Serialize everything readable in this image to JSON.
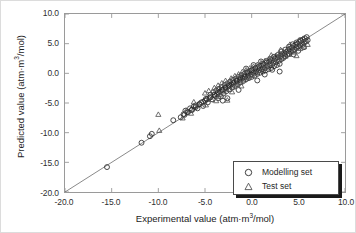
{
  "chart_data": {
    "type": "scatter",
    "title": "",
    "xlabel": "Experimental value (atm·m³/mol)",
    "ylabel": "Predicted value (atm·m³/mol)",
    "xlabel_parts": {
      "pre": "Experimental value (atm·m",
      "sup": "3",
      "post": "/mol)"
    },
    "ylabel_parts": {
      "pre": "Predicted value (atm·m",
      "sup": "3",
      "post": "/mol)"
    },
    "xlim": [
      -20.0,
      10.0
    ],
    "ylim": [
      -20.0,
      10.0
    ],
    "xticks": [
      "-20.0",
      "-15.0",
      "-10.0",
      "-5.0",
      "0.0",
      "5.0",
      "10.0"
    ],
    "yticks": [
      "10.0",
      "5.0",
      "0.0",
      "-5.0",
      "-10.0",
      "-15.0",
      "-20.0"
    ],
    "xtick_values": [
      -20,
      -15,
      -10,
      -5,
      0,
      5,
      10
    ],
    "ytick_values": [
      10,
      5,
      0,
      -5,
      -10,
      -15,
      -20
    ],
    "grid": false,
    "tick_direction": "in",
    "identity_line": {
      "from": [
        -20,
        -20
      ],
      "to": [
        10,
        10
      ],
      "color": "#555555"
    },
    "legend": {
      "position": "bottom-right",
      "entries": [
        {
          "label": "Modelling set",
          "marker": "circle"
        },
        {
          "label": "Test set",
          "marker": "triangle"
        }
      ]
    },
    "series": [
      {
        "name": "Modelling set",
        "marker": "circle",
        "color": "#2a2a2a",
        "points": [
          [
            -15.5,
            -15.8
          ],
          [
            -11.8,
            -11.7
          ],
          [
            -10.9,
            -10.6
          ],
          [
            -10.7,
            -10.2
          ],
          [
            -8.4,
            -7.9
          ],
          [
            -7.6,
            -7.4
          ],
          [
            -7.3,
            -6.9
          ],
          [
            -7.1,
            -6.3
          ],
          [
            -6.9,
            -6.6
          ],
          [
            -6.6,
            -5.9
          ],
          [
            -6.4,
            -6.2
          ],
          [
            -6.2,
            -5.6
          ],
          [
            -6.0,
            -5.4
          ],
          [
            -5.8,
            -5.9
          ],
          [
            -5.6,
            -5.2
          ],
          [
            -5.4,
            -4.9
          ],
          [
            -5.2,
            -5.5
          ],
          [
            -5.0,
            -4.6
          ],
          [
            -4.9,
            -4.3
          ],
          [
            -4.7,
            -4.9
          ],
          [
            -4.5,
            -4.1
          ],
          [
            -4.4,
            -3.6
          ],
          [
            -4.2,
            -4.4
          ],
          [
            -4.1,
            -3.2
          ],
          [
            -3.9,
            -3.8
          ],
          [
            -3.8,
            -2.9
          ],
          [
            -3.7,
            -3.5
          ],
          [
            -3.6,
            -4.2
          ],
          [
            -3.5,
            -2.6
          ],
          [
            -3.4,
            -3.1
          ],
          [
            -3.3,
            -3.9
          ],
          [
            -3.2,
            -2.3
          ],
          [
            -3.1,
            -2.8
          ],
          [
            -3.0,
            -3.4
          ],
          [
            -2.9,
            -2.0
          ],
          [
            -2.8,
            -2.5
          ],
          [
            -2.7,
            -3.0
          ],
          [
            -2.6,
            -1.7
          ],
          [
            -2.5,
            -2.2
          ],
          [
            -2.4,
            -2.7
          ],
          [
            -2.3,
            -1.4
          ],
          [
            -2.2,
            -1.9
          ],
          [
            -2.1,
            -2.4
          ],
          [
            -2.0,
            -1.1
          ],
          [
            -1.9,
            -1.6
          ],
          [
            -1.8,
            -2.1
          ],
          [
            -1.7,
            -0.9
          ],
          [
            -1.6,
            -1.3
          ],
          [
            -1.5,
            -1.8
          ],
          [
            -1.4,
            -0.6
          ],
          [
            -1.3,
            -1.1
          ],
          [
            -1.2,
            -1.5
          ],
          [
            -1.1,
            -0.3
          ],
          [
            -1.0,
            -0.8
          ],
          [
            -0.9,
            -1.3
          ],
          [
            -0.8,
            -0.1
          ],
          [
            -0.7,
            -0.6
          ],
          [
            -0.6,
            -1.0
          ],
          [
            -0.5,
            0.2
          ],
          [
            -0.4,
            -0.4
          ],
          [
            -0.3,
            -0.8
          ],
          [
            -0.2,
            0.4
          ],
          [
            -0.1,
            -0.2
          ],
          [
            0.0,
            -0.6
          ],
          [
            0.1,
            0.6
          ],
          [
            0.2,
            0.1
          ],
          [
            0.3,
            -0.4
          ],
          [
            0.4,
            0.8
          ],
          [
            0.5,
            0.3
          ],
          [
            0.6,
            -0.1
          ],
          [
            0.7,
            1.0
          ],
          [
            0.8,
            0.5
          ],
          [
            0.9,
            0.1
          ],
          [
            1.0,
            1.3
          ],
          [
            1.1,
            0.7
          ],
          [
            1.2,
            0.3
          ],
          [
            1.3,
            1.5
          ],
          [
            1.4,
            0.9
          ],
          [
            1.5,
            0.5
          ],
          [
            1.6,
            1.8
          ],
          [
            1.7,
            1.2
          ],
          [
            1.8,
            0.7
          ],
          [
            1.9,
            2.0
          ],
          [
            2.0,
            1.4
          ],
          [
            2.1,
            0.9
          ],
          [
            2.2,
            2.2
          ],
          [
            2.3,
            1.7
          ],
          [
            2.4,
            1.2
          ],
          [
            2.5,
            2.5
          ],
          [
            2.6,
            1.9
          ],
          [
            2.7,
            1.4
          ],
          [
            2.8,
            2.7
          ],
          [
            2.9,
            2.1
          ],
          [
            3.0,
            0.3
          ],
          [
            3.1,
            2.9
          ],
          [
            3.2,
            2.4
          ],
          [
            3.3,
            3.2
          ],
          [
            3.4,
            2.6
          ],
          [
            3.5,
            3.4
          ],
          [
            3.6,
            2.9
          ],
          [
            3.7,
            3.6
          ],
          [
            3.8,
            3.1
          ],
          [
            3.9,
            3.9
          ],
          [
            4.0,
            3.3
          ],
          [
            4.1,
            4.1
          ],
          [
            4.2,
            3.6
          ],
          [
            4.3,
            4.3
          ],
          [
            4.4,
            3.8
          ],
          [
            4.5,
            4.6
          ],
          [
            4.6,
            4.0
          ],
          [
            4.7,
            4.8
          ],
          [
            4.8,
            4.3
          ],
          [
            4.9,
            5.0
          ],
          [
            5.0,
            4.5
          ],
          [
            5.1,
            5.3
          ],
          [
            5.2,
            4.7
          ],
          [
            5.3,
            5.5
          ],
          [
            5.4,
            5.0
          ],
          [
            5.5,
            5.7
          ],
          [
            5.6,
            5.2
          ],
          [
            5.7,
            5.9
          ],
          [
            5.8,
            5.4
          ],
          [
            5.9,
            6.1
          ],
          [
            6.0,
            5.6
          ],
          [
            5.5,
            4.8
          ],
          [
            5.2,
            5.6
          ],
          [
            4.8,
            5.2
          ],
          [
            4.4,
            4.9
          ],
          [
            4.0,
            4.5
          ],
          [
            3.6,
            4.0
          ],
          [
            3.2,
            3.7
          ],
          [
            2.8,
            3.1
          ],
          [
            2.4,
            2.8
          ],
          [
            2.0,
            2.4
          ],
          [
            1.6,
            2.1
          ],
          [
            1.2,
            1.6
          ],
          [
            0.8,
            1.2
          ],
          [
            0.4,
            0.9
          ],
          [
            0.0,
            0.5
          ],
          [
            -0.4,
            0.1
          ],
          [
            -0.8,
            -0.5
          ],
          [
            -1.2,
            -0.8
          ],
          [
            -1.6,
            -1.2
          ],
          [
            -2.0,
            -1.6
          ],
          [
            -2.4,
            -2.0
          ],
          [
            -2.8,
            -2.4
          ],
          [
            -3.2,
            -2.8
          ],
          [
            -3.6,
            -3.2
          ],
          [
            -4.0,
            -3.6
          ],
          [
            -4.4,
            -4.0
          ],
          [
            -4.8,
            -4.4
          ],
          [
            -5.2,
            -4.8
          ],
          [
            -5.6,
            -5.2
          ],
          [
            -6.0,
            -5.7
          ],
          [
            -6.4,
            -6.1
          ],
          [
            -6.8,
            -6.5
          ],
          [
            -7.2,
            -7.0
          ],
          [
            -3.1,
            -4.6
          ],
          [
            -2.6,
            -4.2
          ],
          [
            -1.4,
            -2.8
          ],
          [
            0.6,
            -1.2
          ],
          [
            1.4,
            -0.2
          ],
          [
            2.2,
            0.6
          ],
          [
            3.0,
            1.6
          ],
          [
            0.2,
            1.4
          ],
          [
            1.0,
            2.0
          ],
          [
            -0.6,
            0.8
          ],
          [
            4.5,
            3.2
          ],
          [
            5.0,
            3.8
          ],
          [
            5.6,
            4.4
          ]
        ]
      },
      {
        "name": "Test set",
        "marker": "triangle",
        "color": "#555555",
        "points": [
          [
            -10.0,
            -7.0
          ],
          [
            -9.9,
            -9.7
          ],
          [
            -7.0,
            -6.3
          ],
          [
            -6.2,
            -4.9
          ],
          [
            -5.5,
            -5.2
          ],
          [
            -5.0,
            -3.4
          ],
          [
            -4.6,
            -3.0
          ],
          [
            -4.3,
            -4.5
          ],
          [
            -4.0,
            -2.5
          ],
          [
            -3.8,
            -4.7
          ],
          [
            -3.6,
            -2.1
          ],
          [
            -3.4,
            -3.6
          ],
          [
            -3.2,
            -1.7
          ],
          [
            -3.0,
            -3.2
          ],
          [
            -2.8,
            -1.3
          ],
          [
            -2.6,
            -4.6
          ],
          [
            -2.4,
            -2.8
          ],
          [
            -2.2,
            -0.9
          ],
          [
            -2.0,
            -2.4
          ],
          [
            -1.8,
            -0.5
          ],
          [
            -1.6,
            -2.0
          ],
          [
            -1.4,
            -0.2
          ],
          [
            -1.2,
            -1.6
          ],
          [
            -1.0,
            0.2
          ],
          [
            -0.8,
            -1.2
          ],
          [
            -0.6,
            0.5
          ],
          [
            -0.4,
            -0.8
          ],
          [
            -0.2,
            0.8
          ],
          [
            0.0,
            -0.4
          ],
          [
            0.2,
            1.1
          ],
          [
            0.4,
            0.0
          ],
          [
            0.6,
            1.4
          ],
          [
            0.8,
            0.4
          ],
          [
            1.0,
            1.7
          ],
          [
            1.2,
            0.8
          ],
          [
            1.4,
            2.0
          ],
          [
            1.6,
            1.1
          ],
          [
            1.8,
            2.3
          ],
          [
            2.0,
            1.5
          ],
          [
            2.2,
            2.6
          ],
          [
            2.4,
            1.8
          ],
          [
            2.6,
            2.9
          ],
          [
            2.8,
            2.2
          ],
          [
            3.0,
            3.2
          ],
          [
            3.2,
            2.5
          ],
          [
            3.4,
            3.5
          ],
          [
            3.6,
            2.8
          ],
          [
            3.8,
            3.8
          ],
          [
            4.0,
            3.1
          ],
          [
            4.2,
            4.1
          ],
          [
            4.4,
            3.5
          ],
          [
            4.6,
            4.4
          ],
          [
            4.8,
            2.9
          ],
          [
            5.0,
            4.7
          ],
          [
            5.2,
            4.1
          ],
          [
            5.4,
            5.0
          ],
          [
            5.6,
            4.4
          ],
          [
            5.8,
            5.3
          ],
          [
            6.0,
            4.8
          ],
          [
            -4.9,
            -5.4
          ],
          [
            -3.5,
            -4.0
          ],
          [
            -2.1,
            -3.2
          ],
          [
            -1.1,
            -2.2
          ],
          [
            2.1,
            3.0
          ],
          [
            3.1,
            3.9
          ],
          [
            4.1,
            4.8
          ],
          [
            5.1,
            5.4
          ],
          [
            5.5,
            5.8
          ],
          [
            -6.5,
            -6.8
          ],
          [
            -7.4,
            -7.6
          ]
        ]
      }
    ]
  }
}
